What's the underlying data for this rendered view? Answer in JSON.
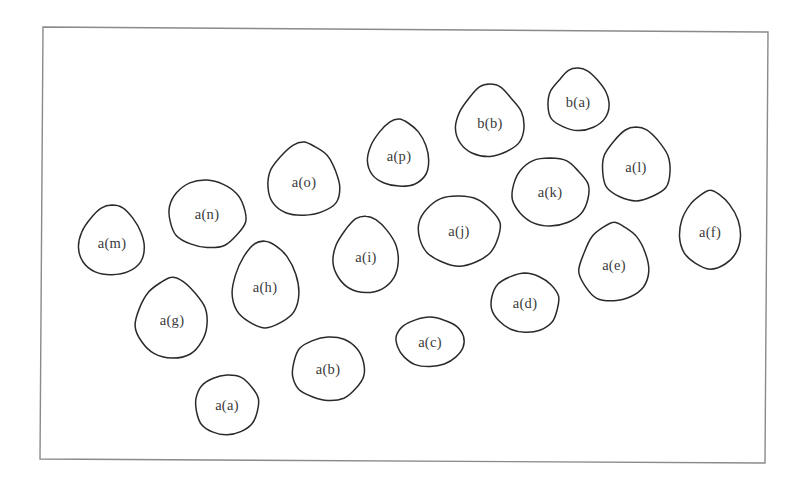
{
  "diagram": {
    "frame": {
      "top_left": [
        43,
        27
      ],
      "top_right": [
        768,
        32
      ],
      "bottom_right": [
        765,
        463
      ],
      "bottom_left": [
        40,
        459
      ],
      "stroke_color": "#8a8a8a"
    },
    "style": {
      "blob_stroke_color": "#2a2a2a",
      "label_color": "#3a3a3a"
    },
    "nodes": [
      {
        "id": "aa",
        "label": "a(a)",
        "cx": 227,
        "cy": 405,
        "rx": 32,
        "ry": 30,
        "shape": "round"
      },
      {
        "id": "ab",
        "label": "a(b)",
        "cx": 328,
        "cy": 369,
        "rx": 36,
        "ry": 32,
        "shape": "round"
      },
      {
        "id": "ac",
        "label": "a(c)",
        "cx": 430,
        "cy": 342,
        "rx": 34,
        "ry": 25,
        "shape": "round"
      },
      {
        "id": "ad",
        "label": "a(d)",
        "cx": 525,
        "cy": 303,
        "rx": 34,
        "ry": 30,
        "shape": "round"
      },
      {
        "id": "ae",
        "label": "a(e)",
        "cx": 614,
        "cy": 262,
        "rx": 38,
        "ry": 40,
        "shape": "teardrop"
      },
      {
        "id": "af",
        "label": "a(f)",
        "cx": 710,
        "cy": 229,
        "rx": 34,
        "ry": 39,
        "shape": "teardrop"
      },
      {
        "id": "ag",
        "label": "a(g)",
        "cx": 172,
        "cy": 317,
        "rx": 40,
        "ry": 40,
        "shape": "teardrop"
      },
      {
        "id": "ah",
        "label": "a(h)",
        "cx": 265,
        "cy": 284,
        "rx": 37,
        "ry": 43,
        "shape": "teardrop"
      },
      {
        "id": "ai",
        "label": "a(i)",
        "cx": 366,
        "cy": 254,
        "rx": 36,
        "ry": 38,
        "shape": "teardrop"
      },
      {
        "id": "aj",
        "label": "a(j)",
        "cx": 459,
        "cy": 231,
        "rx": 41,
        "ry": 35,
        "shape": "round"
      },
      {
        "id": "ak",
        "label": "a(k)",
        "cx": 550,
        "cy": 192,
        "rx": 38,
        "ry": 34,
        "shape": "round"
      },
      {
        "id": "al",
        "label": "a(l)",
        "cx": 636,
        "cy": 164,
        "rx": 38,
        "ry": 37,
        "shape": "teardrop"
      },
      {
        "id": "am",
        "label": "a(m)",
        "cx": 112,
        "cy": 240,
        "rx": 37,
        "ry": 35,
        "shape": "teardrop"
      },
      {
        "id": "an",
        "label": "a(n)",
        "cx": 207,
        "cy": 214,
        "rx": 39,
        "ry": 34,
        "shape": "round"
      },
      {
        "id": "ao",
        "label": "a(o)",
        "cx": 304,
        "cy": 179,
        "rx": 40,
        "ry": 37,
        "shape": "teardrop"
      },
      {
        "id": "ap",
        "label": "a(p)",
        "cx": 399,
        "cy": 153,
        "rx": 34,
        "ry": 34,
        "shape": "teardrop"
      },
      {
        "id": "bb",
        "label": "b(b)",
        "cx": 490,
        "cy": 120,
        "rx": 38,
        "ry": 36,
        "shape": "teardrop"
      },
      {
        "id": "ba",
        "label": "b(a)",
        "cx": 578,
        "cy": 99,
        "rx": 34,
        "ry": 31,
        "shape": "teardrop"
      }
    ]
  }
}
